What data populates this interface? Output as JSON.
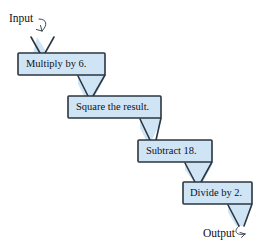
{
  "diagram": {
    "type": "flowchart-cascade",
    "colors": {
      "box_fill": "#cfe5f6",
      "chute_fill": "#cfe5f6",
      "outline": "#2b3640",
      "text": "#101018",
      "background": "#ffffff"
    },
    "input_label": "Input",
    "output_label": "Output",
    "steps": [
      {
        "label": "Multiply by 6.",
        "order": 1
      },
      {
        "label": "Square the result.",
        "order": 2
      },
      {
        "label": "Subtract 18.",
        "order": 3
      },
      {
        "label": "Divide by 2.",
        "order": 4
      }
    ]
  }
}
